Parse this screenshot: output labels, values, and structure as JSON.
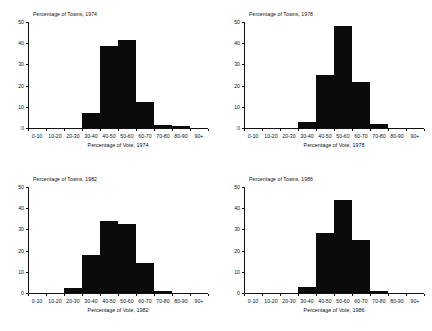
{
  "figure": {
    "background": "#ffffff",
    "bar_color": "#0a0a0a",
    "axis_color": "#111111",
    "panel_count": 4
  },
  "chart_data": [
    {
      "type": "bar",
      "title": "Percentage of Towns, 1974",
      "xlabel": "Percentage of Vote, 1974",
      "ylabel": "",
      "categories": [
        "0-10",
        "10-20",
        "20-30",
        "30-40",
        "40-50",
        "50-60",
        "60-70",
        "70-80",
        "80-90",
        "90+"
      ],
      "values": [
        0,
        0,
        0,
        7,
        38.5,
        41.5,
        12.5,
        1.5,
        0.8,
        0
      ],
      "ylim": [
        0,
        50
      ],
      "yticks": [
        0,
        10,
        20,
        30,
        40,
        50
      ],
      "grid": false,
      "legend": "none"
    },
    {
      "type": "bar",
      "title": "Percentage of Towns, 1978",
      "xlabel": "Percentage of Vote, 1978",
      "ylabel": "",
      "categories": [
        "0-10",
        "10-20",
        "20-30",
        "30-40",
        "40-50",
        "50-60",
        "60-70",
        "70-80",
        "80-90",
        "90+"
      ],
      "values": [
        0,
        0,
        0,
        3,
        25,
        48,
        21.5,
        2,
        0,
        0
      ],
      "ylim": [
        0,
        50
      ],
      "yticks": [
        0,
        10,
        20,
        30,
        40,
        50
      ],
      "grid": false,
      "legend": "none"
    },
    {
      "type": "bar",
      "title": "Percentage of Towns, 1982",
      "xlabel": "Percentage of Vote, 1982",
      "ylabel": "",
      "categories": [
        "0-10",
        "10-20",
        "20-30",
        "30-40",
        "40-50",
        "50-60",
        "60-70",
        "70-80",
        "80-90",
        "90+"
      ],
      "values": [
        0,
        0,
        2.5,
        18,
        34,
        32.5,
        14,
        1,
        0,
        0
      ],
      "ylim": [
        0,
        50
      ],
      "yticks": [
        0,
        10,
        20,
        30,
        40,
        50
      ],
      "grid": false,
      "legend": "none"
    },
    {
      "type": "bar",
      "title": "Percentage of Towns, 1986",
      "xlabel": "Percentage of Vote, 1986",
      "ylabel": "",
      "categories": [
        "0-10",
        "10-20",
        "20-30",
        "30-40",
        "40-50",
        "50-60",
        "60-70",
        "70-80",
        "80-90",
        "90+"
      ],
      "values": [
        0,
        0,
        0,
        3,
        28.5,
        44,
        25,
        1,
        0,
        0
      ],
      "ylim": [
        0,
        50
      ],
      "yticks": [
        0,
        10,
        20,
        30,
        40,
        50
      ],
      "grid": false,
      "legend": "none"
    }
  ]
}
